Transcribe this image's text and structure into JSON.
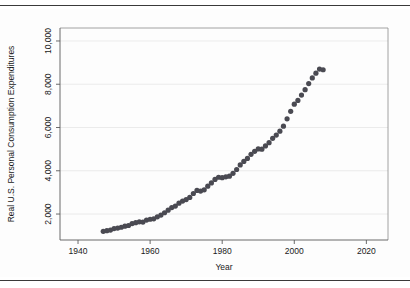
{
  "figure": {
    "background_color": "#fdfdfd",
    "rule_color": "#3a3a3a"
  },
  "chart_data": {
    "type": "scatter",
    "title": "",
    "subtitle": "",
    "xlabel": "Year",
    "ylabel": "Real U.S. Personal Consumption Expenditures",
    "xlim": [
      1935,
      2026
    ],
    "ylim": [
      800,
      10600
    ],
    "xticks": [
      1940,
      1960,
      1980,
      2000,
      2020
    ],
    "xtick_labels": [
      "1940",
      "1960",
      "1980",
      "2000",
      "2020"
    ],
    "yticks": [
      2000,
      4000,
      6000,
      8000,
      10000
    ],
    "ytick_labels": [
      "2,000",
      "4,000",
      "6,000",
      "8,000",
      "10,000"
    ],
    "ytick_label_rotation": 90,
    "ylabel_rotation": 90,
    "grid": "horizontal",
    "grid_color": "#e6e6e6",
    "marker": "circle",
    "marker_color": "#4a4a52",
    "marker_size": 2.6,
    "x": [
      1947,
      1948,
      1949,
      1950,
      1951,
      1952,
      1953,
      1954,
      1955,
      1956,
      1957,
      1958,
      1959,
      1960,
      1961,
      1962,
      1963,
      1964,
      1965,
      1966,
      1967,
      1968,
      1969,
      1970,
      1971,
      1972,
      1973,
      1974,
      1975,
      1976,
      1977,
      1978,
      1979,
      1980,
      1981,
      1982,
      1983,
      1984,
      1985,
      1986,
      1987,
      1988,
      1989,
      1990,
      1991,
      1992,
      1993,
      1994,
      1995,
      1996,
      1997,
      1998,
      1999,
      2000,
      2001,
      2002,
      2003,
      2004,
      2005,
      2006,
      2007,
      2008
    ],
    "y": [
      1200,
      1230,
      1260,
      1330,
      1350,
      1390,
      1440,
      1470,
      1560,
      1600,
      1640,
      1630,
      1720,
      1760,
      1780,
      1870,
      1950,
      2060,
      2180,
      2300,
      2370,
      2500,
      2600,
      2670,
      2770,
      2950,
      3090,
      3060,
      3120,
      3290,
      3440,
      3600,
      3700,
      3680,
      3720,
      3750,
      3880,
      4060,
      4270,
      4430,
      4570,
      4760,
      4900,
      5010,
      5000,
      5150,
      5300,
      5500,
      5650,
      5830,
      6060,
      6400,
      6750,
      7080,
      7250,
      7500,
      7750,
      8030,
      8290,
      8510,
      8700,
      8670
    ],
    "legend": null,
    "annotations": []
  }
}
